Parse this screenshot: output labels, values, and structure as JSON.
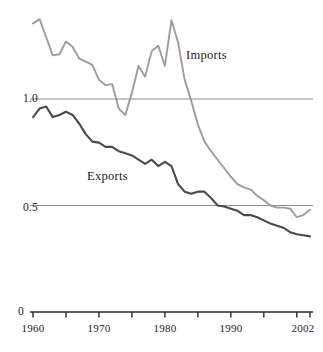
{
  "chart_data": {
    "type": "line",
    "title": "",
    "subtitle": "",
    "xlabel": "",
    "ylabel": "",
    "xlim": [
      1960,
      2002
    ],
    "ylim": [
      0,
      1.45
    ],
    "grid": "horizontal gridlines at 0.5 and 1.0",
    "legend_position": "inline annotations on curves",
    "y_tick_labels": [
      "1.0",
      "0.5",
      "0"
    ],
    "y_tick_values": [
      1.0,
      0.5,
      0
    ],
    "x_tick_values": [
      1960,
      1965,
      1970,
      1975,
      1980,
      1985,
      1990,
      1995,
      2000,
      2002
    ],
    "x_tick_labels": [
      "1960",
      "",
      "1970",
      "",
      "1980",
      "",
      "1990",
      "",
      "",
      "2002"
    ],
    "x_labeled_ticks": [
      {
        "value": 1960,
        "label": "1960"
      },
      {
        "value": 1970,
        "label": "1970"
      },
      {
        "value": 1980,
        "label": "1980"
      },
      {
        "value": 1990,
        "label": "1990"
      },
      {
        "value": 2002,
        "label": "2002"
      }
    ],
    "annotations": [
      {
        "text": "Imports",
        "x": 1986,
        "y": 1.22
      },
      {
        "text": "Exports",
        "x": 1971,
        "y": 0.67
      }
    ],
    "series": [
      {
        "name": "Imports",
        "color": "#9c9c9c",
        "x": [
          1960,
          1961,
          1962,
          1963,
          1964,
          1965,
          1966,
          1967,
          1968,
          1969,
          1970,
          1971,
          1972,
          1973,
          1974,
          1975,
          1976,
          1977,
          1978,
          1979,
          1980,
          1981,
          1982,
          1983,
          1984,
          1985,
          1986,
          1987,
          1988,
          1989,
          1990,
          1991,
          1992,
          1993,
          1994,
          1995,
          1996,
          1997,
          1998,
          1999,
          2000,
          2001,
          2002
        ],
        "values": [
          1.355,
          1.375,
          1.29,
          1.205,
          1.21,
          1.27,
          1.245,
          1.19,
          1.175,
          1.16,
          1.09,
          1.065,
          1.07,
          0.955,
          0.925,
          1.03,
          1.155,
          1.105,
          1.225,
          1.25,
          1.155,
          1.37,
          1.265,
          1.09,
          0.99,
          0.88,
          0.8,
          0.755,
          0.715,
          0.675,
          0.635,
          0.6,
          0.585,
          0.575,
          0.545,
          0.525,
          0.5,
          0.49,
          0.49,
          0.485,
          0.445,
          0.455,
          0.48
        ]
      },
      {
        "name": "Exports",
        "color": "#4a4a4a",
        "x": [
          1960,
          1961,
          1962,
          1963,
          1964,
          1965,
          1966,
          1967,
          1968,
          1969,
          1970,
          1971,
          1972,
          1973,
          1974,
          1975,
          1976,
          1977,
          1978,
          1979,
          1980,
          1981,
          1982,
          1983,
          1984,
          1985,
          1986,
          1987,
          1988,
          1989,
          1990,
          1991,
          1992,
          1993,
          1994,
          1995,
          1996,
          1997,
          1998,
          1999,
          2000,
          2001,
          2002
        ],
        "values": [
          0.915,
          0.955,
          0.965,
          0.915,
          0.925,
          0.94,
          0.925,
          0.885,
          0.835,
          0.8,
          0.795,
          0.775,
          0.775,
          0.755,
          0.745,
          0.735,
          0.715,
          0.695,
          0.715,
          0.685,
          0.705,
          0.685,
          0.6,
          0.565,
          0.555,
          0.565,
          0.565,
          0.535,
          0.5,
          0.495,
          0.485,
          0.475,
          0.455,
          0.455,
          0.445,
          0.43,
          0.415,
          0.405,
          0.395,
          0.375,
          0.365,
          0.36,
          0.355
        ]
      }
    ]
  },
  "axes": {
    "ylabel_1": "1.0",
    "ylabel_05": "0.5",
    "ylabel_0": "0",
    "xlabel_1960": "1960",
    "xlabel_1970": "1970",
    "xlabel_1980": "1980",
    "xlabel_1990": "1990",
    "xlabel_2002": "2002"
  },
  "annotations": {
    "imports": "Imports",
    "exports": "Exports"
  },
  "colors": {
    "imports_line": "#9c9c9c",
    "exports_line": "#4a4a4a",
    "gridline": "#8d8d8d",
    "axis": "#2a2a2a",
    "text": "#1b1b1b",
    "background": "#ffffff"
  }
}
